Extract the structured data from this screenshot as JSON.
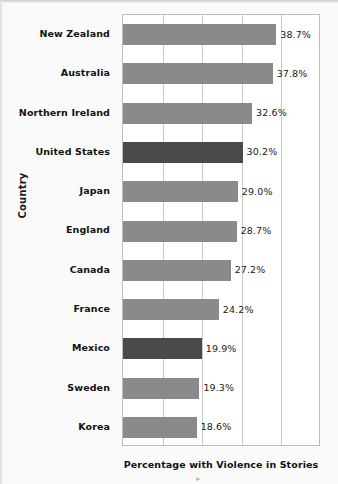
{
  "chart_data": {
    "type": "bar",
    "orientation": "horizontal",
    "title": "",
    "xlabel": "Percentage with Violence in Stories",
    "ylabel": "Country",
    "xlim": [
      0,
      50
    ],
    "grid": true,
    "gridline_values": [
      0,
      10,
      20,
      30,
      40,
      50
    ],
    "legend": false,
    "categories": [
      "New Zealand",
      "Australia",
      "Northern Ireland",
      "United States",
      "Japan",
      "England",
      "Canada",
      "France",
      "Mexico",
      "Sweden",
      "Korea"
    ],
    "values": [
      38.7,
      37.8,
      32.6,
      30.2,
      29.0,
      28.7,
      27.2,
      24.2,
      19.9,
      19.3,
      18.6
    ],
    "value_labels": [
      "38.7%",
      "37.8%",
      "32.6%",
      "30.2%",
      "29.0%",
      "28.7%",
      "27.2%",
      "24.2%",
      "19.9%",
      "19.3%",
      "18.6%"
    ],
    "highlighted": [
      "United States",
      "Mexico"
    ],
    "colors": {
      "bar": "#8a8a8a",
      "bar_highlight": "#4a4a4a",
      "plot_background": "#ffffff",
      "gridline": "#c9c9c9",
      "axis_border": "#bdbdbd",
      "page_background": "#fafafa",
      "text": "#111111"
    }
  }
}
